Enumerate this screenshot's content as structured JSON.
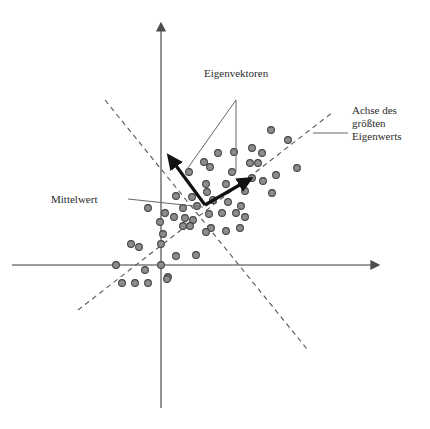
{
  "figure": {
    "title_labels": {
      "eigenvectors": "Eigenvektoren",
      "largest_eigenvalue_axis_line1": "Achse des",
      "largest_eigenvalue_axis_line2": "größten",
      "largest_eigenvalue_axis_line3": "Eigenwerts",
      "mean": "Mittelwert"
    },
    "colors": {
      "axis": "#7a7a7a",
      "dashed_line": "#555555",
      "point_fill": "#8d8d8d",
      "point_stroke": "#454545",
      "arrow": "#111111",
      "leader_line": "#666666",
      "text": "#2b2b2b",
      "background": "#ffffff"
    }
  },
  "chart_data": {
    "type": "scatter",
    "title": "",
    "xlabel": "",
    "ylabel": "",
    "grid": false,
    "legend_position": "none",
    "axes": {
      "origin_px": [
        161,
        265
      ],
      "x_axis": {
        "from_px": [
          12,
          265
        ],
        "to_px": [
          380,
          265
        ],
        "arrow": "right"
      },
      "y_axis": {
        "from_px": [
          161,
          408
        ],
        "to_px": [
          161,
          22
        ],
        "arrow": "up"
      }
    },
    "annotations": [
      {
        "name": "eigenvectors",
        "text": "Eigenvektoren",
        "text_px": [
          204,
          67
        ],
        "leader_lines": [
          {
            "from_px": [
              236,
              100
            ],
            "to_px": [
              185,
              172
            ]
          },
          {
            "from_px": [
              236,
              100
            ],
            "to_px": [
              236,
              172
            ]
          }
        ]
      },
      {
        "name": "largest-eigenvalue-axis",
        "text": "Achse des größten Eigenwerts",
        "text_px": [
          352,
          104
        ],
        "leader_lines": [
          {
            "from_px": [
              313,
              133
            ],
            "to_px": [
              348,
              133
            ]
          }
        ]
      },
      {
        "name": "mean",
        "text": "Mittelwert",
        "text_px": [
          51,
          193
        ],
        "leader_lines": [
          {
            "from_px": [
              128,
              199
            ],
            "to_px": [
              203,
              207
            ]
          }
        ]
      }
    ],
    "vectors": [
      {
        "name": "eigenvector-1",
        "from_px": [
          205,
          205
        ],
        "to_px": [
          170,
          158
        ],
        "style": "thick-arrow"
      },
      {
        "name": "eigenvector-2",
        "from_px": [
          205,
          205
        ],
        "to_px": [
          248,
          180
        ],
        "style": "thick-arrow"
      }
    ],
    "dashed_axes": [
      {
        "name": "principal-axis-major",
        "from_px": [
          78,
          310
        ],
        "to_px": [
          333,
          112
        ]
      },
      {
        "name": "principal-axis-minor",
        "from_px": [
          105,
          100
        ],
        "to_px": [
          307,
          349
        ]
      }
    ],
    "points_px": [
      [
        271,
        130
      ],
      [
        288,
        140
      ],
      [
        252,
        148
      ],
      [
        262,
        153
      ],
      [
        234,
        152
      ],
      [
        250,
        163
      ],
      [
        258,
        163
      ],
      [
        297,
        168
      ],
      [
        218,
        153
      ],
      [
        204,
        162
      ],
      [
        210,
        167
      ],
      [
        232,
        172
      ],
      [
        252,
        178
      ],
      [
        263,
        181
      ],
      [
        276,
        175
      ],
      [
        189,
        172
      ],
      [
        272,
        193
      ],
      [
        245,
        191
      ],
      [
        226,
        184
      ],
      [
        206,
        184
      ],
      [
        207,
        192
      ],
      [
        192,
        197
      ],
      [
        176,
        196
      ],
      [
        213,
        200
      ],
      [
        228,
        202
      ],
      [
        241,
        206
      ],
      [
        197,
        206
      ],
      [
        183,
        208
      ],
      [
        148,
        208
      ],
      [
        165,
        213
      ],
      [
        174,
        217
      ],
      [
        209,
        214
      ],
      [
        222,
        213
      ],
      [
        236,
        213
      ],
      [
        245,
        217
      ],
      [
        160,
        222
      ],
      [
        185,
        218
      ],
      [
        193,
        220
      ],
      [
        183,
        226
      ],
      [
        190,
        226
      ],
      [
        211,
        228
      ],
      [
        226,
        231
      ],
      [
        240,
        228
      ],
      [
        163,
        234
      ],
      [
        206,
        232
      ],
      [
        131,
        244
      ],
      [
        139,
        247
      ],
      [
        161,
        244
      ],
      [
        176,
        256
      ],
      [
        196,
        255
      ],
      [
        161,
        265
      ],
      [
        116,
        265
      ],
      [
        145,
        270
      ],
      [
        168,
        277
      ],
      [
        122,
        283
      ],
      [
        135,
        283
      ],
      [
        148,
        283
      ],
      [
        167,
        279
      ]
    ]
  }
}
